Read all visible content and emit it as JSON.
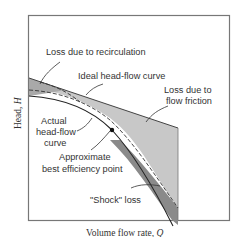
{
  "figure": {
    "x_axis_label": "Volume flow rate, ",
    "x_axis_symbol": "Q",
    "y_axis_label": "Head, ",
    "y_axis_symbol": "H",
    "annotations": {
      "recirculation": "Loss due to recirculation",
      "ideal_line1": "Ideal head-flow curve",
      "friction_line1": "Loss due to",
      "friction_line2": "flow friction",
      "actual_line1": "Actual",
      "actual_line2": "head-flow",
      "actual_line3": "curve",
      "bep_line1": "Approximate",
      "bep_line2": "best efficiency point",
      "shock": "\"Shock\" loss"
    },
    "colors": {
      "frame": "#777777",
      "friction_fill": "#c8c8c8",
      "shock_fill": "#8a8a8a",
      "recirc_fill": "#a8a8a8",
      "curve": "#333333"
    }
  }
}
